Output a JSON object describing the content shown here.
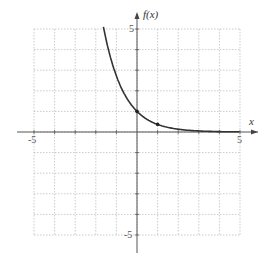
{
  "chart_data": {
    "type": "line",
    "title": "",
    "xlabel": "x",
    "ylabel": "f(x)",
    "xlim": [
      -5,
      5
    ],
    "ylim": [
      -5,
      5
    ],
    "grid": true,
    "x_tick_labels": [
      "-5",
      "5"
    ],
    "y_tick_labels": [
      "5",
      "-5"
    ],
    "series": [
      {
        "name": "f(x) = e^(-x)",
        "x": [
          -1.6,
          -1,
          0,
          1,
          2,
          3,
          4,
          5
        ],
        "values": [
          4.95,
          2.72,
          1,
          0.37,
          0.14,
          0.05,
          0.02,
          0.01
        ]
      }
    ],
    "marked_points": [
      {
        "x": 0,
        "y": 1
      },
      {
        "x": 1,
        "y": 0.37
      }
    ]
  },
  "labels": {
    "x_axis": "x",
    "y_axis": "f(x)",
    "x_min": "-5",
    "x_max": "5",
    "y_max": "5",
    "y_min": "-5"
  }
}
